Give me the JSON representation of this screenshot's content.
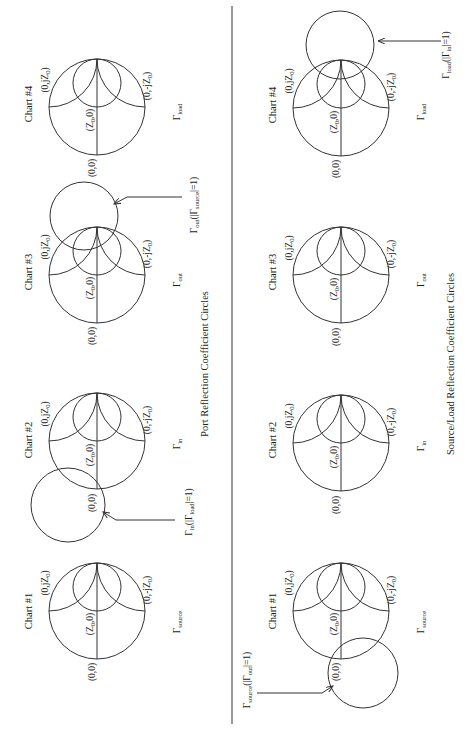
{
  "panels": [
    {
      "title": "Port Reflection Coefficient Circles",
      "charts": [
        {
          "name": "Chart #1",
          "gamma": "Γ",
          "gamma_sub": "source",
          "pt_open_neg": "(0,-jZ",
          "pt_open_pos": "(0,jZ",
          "pt_short": "(0,0)",
          "pt_center": "(Z",
          "pt_center_tail": ",0)",
          "z_sub": "0"
        },
        {
          "name": "Chart #2",
          "gamma": "Γ",
          "gamma_sub": "in",
          "pt_open_neg": "(0,-jZ",
          "pt_open_pos": "(0,jZ",
          "pt_short": "(0,0)",
          "pt_center": "(Z",
          "pt_center_tail": ",0)",
          "z_sub": "0",
          "annotation": {
            "main": "Γ",
            "main_sub": "in",
            "paren_open": "(|Γ",
            "inner_sub": "load",
            "paren_close": "|=1)"
          }
        },
        {
          "name": "Chart #3",
          "gamma": "Γ",
          "gamma_sub": "out",
          "pt_open_neg": "(0,-jZ",
          "pt_open_pos": "(0,jZ",
          "pt_short": "(0,0)",
          "pt_center": "(Z",
          "pt_center_tail": ",0)",
          "z_sub": "0",
          "annotation": {
            "main": "Γ",
            "main_sub": "out",
            "paren_open": "(|Γ",
            "inner_sub": "source",
            "paren_close": "|=1)"
          }
        },
        {
          "name": "Chart #4",
          "gamma": "Γ",
          "gamma_sub": "load",
          "pt_open_neg": "(0,-jZ",
          "pt_open_pos": "(0,jZ",
          "pt_short": "(0,0)",
          "pt_center": "(Z",
          "pt_center_tail": ",0)",
          "z_sub": "0"
        }
      ]
    },
    {
      "title": "Source/Load Reflection Coefficient Circles",
      "charts": [
        {
          "name": "Chart #1",
          "gamma": "Γ",
          "gamma_sub": "source",
          "pt_open_neg": "(0,-jZ",
          "pt_open_pos": "(0,jZ",
          "pt_short": "(0,0)",
          "pt_center": "(Z",
          "pt_center_tail": ",0)",
          "z_sub": "0",
          "annotation": {
            "main": "Γ",
            "main_sub": "source",
            "paren_open": "(|Γ",
            "inner_sub": "out",
            "paren_close": "|=1)"
          }
        },
        {
          "name": "Chart #2",
          "gamma": "Γ",
          "gamma_sub": "in",
          "pt_open_neg": "(0,-jZ",
          "pt_open_pos": "(0,jZ",
          "pt_short": "(0,0)",
          "pt_center": "(Z",
          "pt_center_tail": ",0)",
          "z_sub": "0"
        },
        {
          "name": "Chart #3",
          "gamma": "Γ",
          "gamma_sub": "out",
          "pt_open_neg": "(0,-jZ",
          "pt_open_pos": "(0,jZ",
          "pt_short": "(0,0)",
          "pt_center": "(Z",
          "pt_center_tail": ",0)",
          "z_sub": "0"
        },
        {
          "name": "Chart #4",
          "gamma": "Γ",
          "gamma_sub": "load",
          "pt_open_neg": "(0,-jZ",
          "pt_open_pos": "(0,jZ",
          "pt_short": "(0,0)",
          "pt_center": "(Z",
          "pt_center_tail": ",0)",
          "z_sub": "0",
          "annotation": {
            "main": "Γ",
            "main_sub": "load",
            "paren_open": "(|Γ",
            "inner_sub": "in",
            "paren_close": "|=1)"
          }
        }
      ]
    }
  ],
  "colors": {
    "line": "#333333",
    "text": "#222222",
    "background": "#ffffff"
  }
}
